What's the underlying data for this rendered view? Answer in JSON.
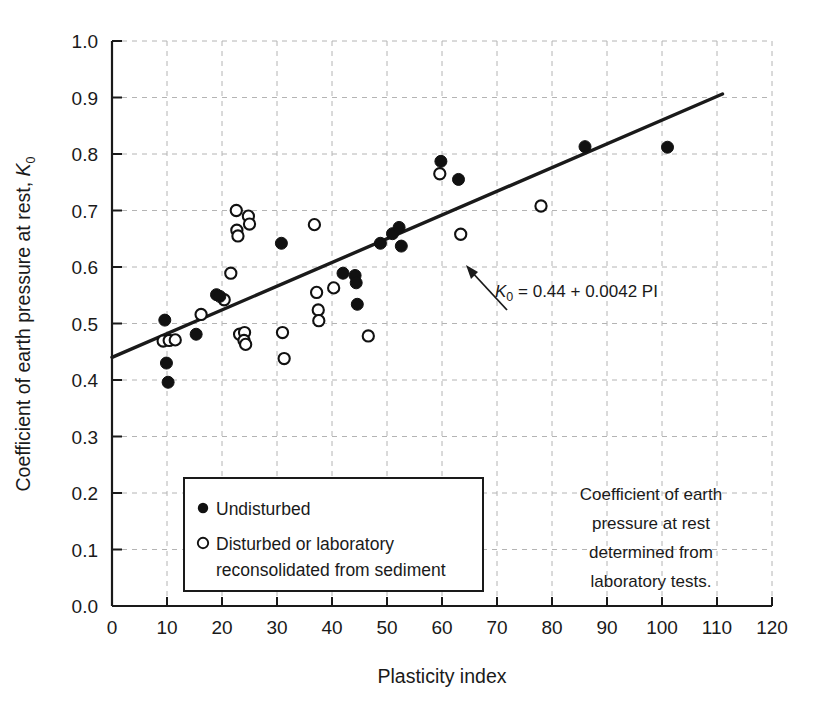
{
  "chart_data": {
    "type": "scatter",
    "title": "",
    "xlabel": "Plasticity index",
    "ylabel": "Coefficient of earth pressure at rest, K0",
    "ylabel_main": "Coefficient of earth pressure at rest, ",
    "ylabel_symbol": "K",
    "ylabel_symbol_sub": "0",
    "xlim": [
      0,
      120
    ],
    "ylim": [
      0,
      1.0
    ],
    "xticks": [
      0,
      10,
      20,
      30,
      40,
      50,
      60,
      70,
      80,
      90,
      100,
      110,
      120
    ],
    "yticks": [
      "0.0",
      "0.1",
      "0.2",
      "0.3",
      "0.4",
      "0.5",
      "0.6",
      "0.7",
      "0.8",
      "0.9",
      "1.0"
    ],
    "xtick_labels": [
      "0",
      "10",
      "20",
      "30",
      "40",
      "50",
      "60",
      "70",
      "80",
      "90",
      "100",
      "110",
      "120"
    ],
    "grid": true,
    "grid_style": "dashed",
    "grid_color": "#b4b4b4",
    "axis_color": "#1a1a1a",
    "marker_color": "#111111",
    "legend_position": "lower-left-inside",
    "series": [
      {
        "name": "Undisturbed",
        "marker": "filled-circle",
        "points": [
          [
            9.6,
            0.506
          ],
          [
            9.9,
            0.43
          ],
          [
            10.2,
            0.396
          ],
          [
            15.3,
            0.481
          ],
          [
            19.0,
            0.551
          ],
          [
            19.6,
            0.548
          ],
          [
            30.8,
            0.642
          ],
          [
            42.0,
            0.589
          ],
          [
            44.2,
            0.585
          ],
          [
            44.4,
            0.572
          ],
          [
            44.6,
            0.534
          ],
          [
            48.8,
            0.642
          ],
          [
            51.0,
            0.659
          ],
          [
            52.2,
            0.67
          ],
          [
            52.6,
            0.637
          ],
          [
            59.8,
            0.787
          ],
          [
            63.0,
            0.755
          ],
          [
            86.0,
            0.813
          ],
          [
            101.0,
            0.812
          ]
        ]
      },
      {
        "name": "Disturbed or laboratory reconsolidated from sediment",
        "marker": "open-circle",
        "points": [
          [
            9.3,
            0.469
          ],
          [
            10.4,
            0.47
          ],
          [
            11.5,
            0.471
          ],
          [
            16.2,
            0.516
          ],
          [
            20.4,
            0.542
          ],
          [
            22.6,
            0.7
          ],
          [
            22.7,
            0.665
          ],
          [
            22.9,
            0.655
          ],
          [
            24.8,
            0.69
          ],
          [
            25.0,
            0.676
          ],
          [
            21.6,
            0.589
          ],
          [
            23.2,
            0.481
          ],
          [
            24.1,
            0.484
          ],
          [
            24.0,
            0.47
          ],
          [
            24.3,
            0.463
          ],
          [
            31.0,
            0.484
          ],
          [
            31.3,
            0.438
          ],
          [
            36.8,
            0.675
          ],
          [
            37.2,
            0.555
          ],
          [
            37.5,
            0.524
          ],
          [
            37.6,
            0.505
          ],
          [
            40.3,
            0.563
          ],
          [
            46.6,
            0.478
          ],
          [
            59.6,
            0.765
          ],
          [
            63.4,
            0.658
          ],
          [
            78.0,
            0.708
          ]
        ]
      }
    ],
    "fit_line": {
      "label": "K0 = 0.44 + 0.0042 PI",
      "label_parts": {
        "symbol": "K",
        "subscript": "0",
        "rest": " = 0.44 + 0.0042 PI"
      },
      "intercept": 0.44,
      "slope": 0.0042,
      "x_start": 0,
      "x_end": 111,
      "color": "#1a1a1a"
    }
  },
  "legend": {
    "items": [
      {
        "marker": "filled-circle",
        "label": "Undisturbed",
        "label_line2": ""
      },
      {
        "marker": "open-circle",
        "label": "Disturbed or laboratory",
        "label_line2": "reconsolidated from sediment"
      }
    ]
  },
  "annotation": {
    "lines": [
      "Coefficient of earth",
      "pressure at rest",
      "determined from",
      "laboratory tests."
    ]
  }
}
